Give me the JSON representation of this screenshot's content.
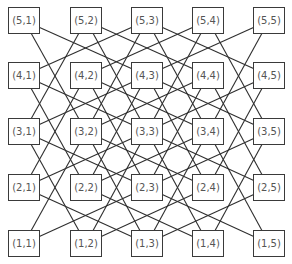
{
  "diagram": {
    "rows": [
      5,
      4,
      3,
      2,
      1
    ],
    "cols": [
      1,
      2,
      3,
      4,
      5
    ],
    "nodes": [
      {
        "r": 5,
        "c": 1,
        "label": "(5,1)"
      },
      {
        "r": 5,
        "c": 2,
        "label": "(5,2)"
      },
      {
        "r": 5,
        "c": 3,
        "label": "(5,3)"
      },
      {
        "r": 5,
        "c": 4,
        "label": "(5,4)"
      },
      {
        "r": 5,
        "c": 5,
        "label": "(5,5)"
      },
      {
        "r": 4,
        "c": 1,
        "label": "(4,1)"
      },
      {
        "r": 4,
        "c": 2,
        "label": "(4,2)"
      },
      {
        "r": 4,
        "c": 3,
        "label": "(4,3)"
      },
      {
        "r": 4,
        "c": 4,
        "label": "(4,4)"
      },
      {
        "r": 4,
        "c": 5,
        "label": "(4,5)"
      },
      {
        "r": 3,
        "c": 1,
        "label": "(3,1)"
      },
      {
        "r": 3,
        "c": 2,
        "label": "(3,2)"
      },
      {
        "r": 3,
        "c": 3,
        "label": "(3,3)"
      },
      {
        "r": 3,
        "c": 4,
        "label": "(3,4)"
      },
      {
        "r": 3,
        "c": 5,
        "label": "(3,5)"
      },
      {
        "r": 2,
        "c": 1,
        "label": "(2,1)"
      },
      {
        "r": 2,
        "c": 2,
        "label": "(2,2)"
      },
      {
        "r": 2,
        "c": 3,
        "label": "(2,3)"
      },
      {
        "r": 2,
        "c": 4,
        "label": "(2,4)"
      },
      {
        "r": 2,
        "c": 5,
        "label": "(2,5)"
      },
      {
        "r": 1,
        "c": 1,
        "label": "(1,1)"
      },
      {
        "r": 1,
        "c": 2,
        "label": "(1,2)"
      },
      {
        "r": 1,
        "c": 3,
        "label": "(1,3)"
      },
      {
        "r": 1,
        "c": 4,
        "label": "(1,4)"
      },
      {
        "r": 1,
        "c": 5,
        "label": "(1,5)"
      }
    ],
    "edge_rule": "knight-move",
    "colors": {
      "stroke": "#2e2e2e",
      "text": "#555555",
      "background": "#ffffff"
    }
  }
}
